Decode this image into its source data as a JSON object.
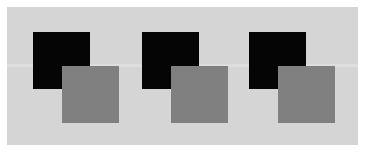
{
  "figure": {
    "canvas": {
      "width_px": 368,
      "height_px": 154,
      "background_color": "#ffffff"
    },
    "panel": {
      "label": "light gray panel",
      "x": 7,
      "y": 7,
      "width": 351,
      "height": 138,
      "color": "#d5d5d5",
      "band": {
        "label": "lighter horizontal band",
        "y": 64,
        "height": 3,
        "color": "#dedede"
      }
    },
    "palette": {
      "background": "#ffffff",
      "panel": "#d5d5d5",
      "band": "#dedede",
      "dark_square": "#050505",
      "mid_square": "#808080"
    },
    "square_size_px": 57,
    "offset_px": {
      "dx": 29,
      "dy": 34
    },
    "groups": [
      {
        "name": "group-1",
        "left": 33,
        "dark_square": {
          "name": "dark-square-1",
          "x": 33,
          "y": 32,
          "color": "#050505"
        },
        "mid_square": {
          "name": "mid-square-1",
          "x": 62,
          "y": 66,
          "color": "#808080"
        }
      },
      {
        "name": "group-2",
        "left": 142,
        "dark_square": {
          "name": "dark-square-2",
          "x": 142,
          "y": 32,
          "color": "#050505"
        },
        "mid_square": {
          "name": "mid-square-2",
          "x": 171,
          "y": 66,
          "color": "#808080"
        }
      },
      {
        "name": "group-3",
        "left": 249,
        "dark_square": {
          "name": "dark-square-3",
          "x": 249,
          "y": 32,
          "color": "#050505"
        },
        "mid_square": {
          "name": "mid-square-3",
          "x": 278,
          "y": 66,
          "color": "#808080"
        }
      }
    ]
  }
}
